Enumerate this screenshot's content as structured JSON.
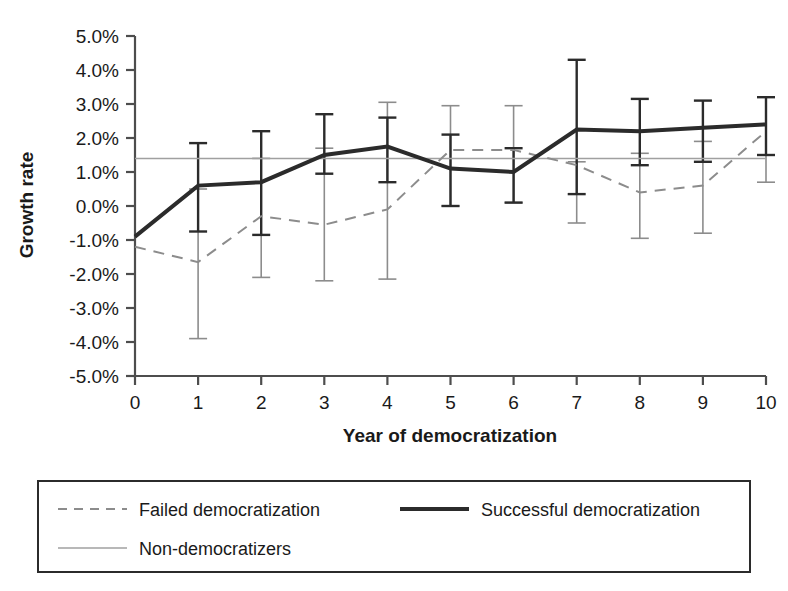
{
  "chart_data": {
    "type": "line",
    "title": "",
    "xlabel": "Year of democratization",
    "ylabel": "Growth rate",
    "x": [
      0,
      1,
      2,
      3,
      4,
      5,
      6,
      7,
      8,
      9,
      10
    ],
    "xticklabels": [
      "0",
      "1",
      "2",
      "3",
      "4",
      "5",
      "6",
      "7",
      "8",
      "9",
      "10"
    ],
    "yticklabels": [
      "5.0%",
      "4.0%",
      "3.0%",
      "2.0%",
      "1.0%",
      "0.0%",
      "-1.0%",
      "-2.0%",
      "-3.0%",
      "-4.0%",
      "-5.0%"
    ],
    "ytickvalues": [
      5.0,
      4.0,
      3.0,
      2.0,
      1.0,
      0.0,
      -1.0,
      -2.0,
      -3.0,
      -4.0,
      -5.0
    ],
    "ylim": [
      -5.0,
      5.0
    ],
    "xlim": [
      0,
      10
    ],
    "grid": false,
    "legend_position": "below-plot-boxed",
    "series": [
      {
        "name": "Failed democratization",
        "style": "dashed",
        "color": "#8c8c8c",
        "width": 2,
        "values": [
          -1.2,
          -1.65,
          -0.3,
          -0.55,
          -0.1,
          1.65,
          1.65,
          1.2,
          0.4,
          0.6,
          2.2
        ],
        "error_upper": [
          null,
          0.5,
          1.4,
          1.7,
          3.05,
          2.95,
          2.95,
          1.3,
          1.55,
          1.9,
          3.2
        ],
        "error_lower": [
          null,
          -3.9,
          -2.1,
          -2.2,
          -2.15,
          0.0,
          0.1,
          -0.5,
          -0.95,
          -0.8,
          0.7
        ]
      },
      {
        "name": "Successful democratization",
        "style": "solid",
        "color": "#2b2b2b",
        "width": 4,
        "values": [
          -0.9,
          0.6,
          0.7,
          1.5,
          1.75,
          1.1,
          1.0,
          2.25,
          2.2,
          2.3,
          2.4
        ],
        "error_upper": [
          null,
          1.85,
          2.2,
          2.7,
          2.6,
          2.1,
          1.7,
          4.3,
          3.15,
          3.1,
          3.2
        ],
        "error_lower": [
          null,
          -0.75,
          -0.85,
          0.95,
          0.7,
          0.0,
          0.1,
          0.35,
          1.2,
          1.3,
          1.5
        ]
      },
      {
        "name": "Non-democratizers",
        "style": "solid-thin",
        "color": "#a0a0a0",
        "width": 1.5,
        "constant_value": 1.4,
        "values": [
          1.4,
          1.4,
          1.4,
          1.4,
          1.4,
          1.4,
          1.4,
          1.4,
          1.4,
          1.4,
          1.4
        ]
      }
    ]
  },
  "legend": {
    "entries": [
      {
        "label": "Failed democratization"
      },
      {
        "label": "Successful democratization"
      },
      {
        "label": "Non-democratizers"
      }
    ]
  }
}
